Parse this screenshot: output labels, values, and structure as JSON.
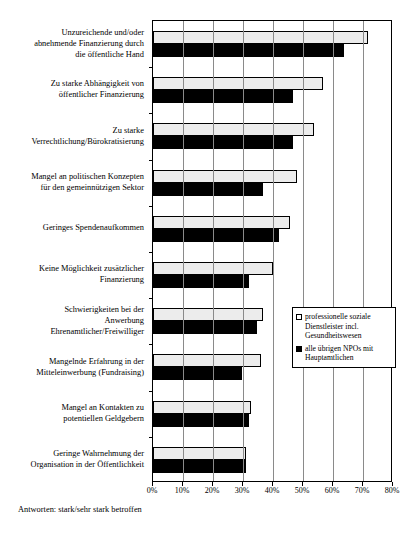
{
  "chart_data": {
    "type": "bar",
    "orientation": "horizontal",
    "title": "",
    "xlabel": "",
    "ylabel": "",
    "xlim": [
      0,
      80
    ],
    "xtick_labels": [
      "0%",
      "10%",
      "20%",
      "30%",
      "40%",
      "50%",
      "60%",
      "70%",
      "80%"
    ],
    "xtick_values": [
      0,
      10,
      20,
      30,
      40,
      50,
      60,
      70,
      80
    ],
    "grid": true,
    "legend_position": "center-right",
    "categories": [
      "Unzureichende und/oder abnehmende Finanzierung durch die öffentliche Hand",
      "Zu starke Abhängigkeit von öffentlicher Finanzierung",
      "Zu starke Verrechtlichung/Bürokratisierung",
      "Mangel an politischen Konzepten für den gemeinnützigen Sektor",
      "Geringes Spendenaufkommen",
      "Keine Möglichkeit zusätzlicher Finanzierung",
      "Schwierigkeiten bei der Anwerbung Ehrenamtlicher/Freiwilliger",
      "Mangelnde Erfahrung in der Mitteleinwerbung (Fundraising)",
      "Mangel an Kontakten zu potentiellen Geldgebern",
      "Geringe Wahrnehmung der Organisation in der Öffentlichkeit"
    ],
    "series": [
      {
        "name": "professionelle soziale Dienstleister incl. Gesundheitswesen",
        "color": "#ececec",
        "values": [
          71.5,
          56.5,
          53.5,
          48.0,
          45.5,
          40.0,
          36.5,
          36.0,
          32.5,
          31.0
        ]
      },
      {
        "name": "alle übrigen NPOs mit Hauptamtlichen",
        "color": "#000000",
        "values": [
          63.5,
          46.5,
          46.5,
          36.5,
          42.0,
          32.0,
          34.5,
          29.5,
          32.0,
          31.0
        ]
      }
    ],
    "footnote": "Antworten: stark/sehr stark betroffen"
  },
  "legend": {
    "items": [
      {
        "swatch": "light",
        "lines": [
          "professionelle soziale",
          "Dienstleister incl.",
          "Gesundheitswesen"
        ]
      },
      {
        "swatch": "dark",
        "lines": [
          "alle übrigen NPOs mit",
          "Hauptamtlichen"
        ]
      }
    ]
  },
  "category_label_lines": [
    [
      "Unzureichende und/oder",
      "abnehmende Finanzierung durch",
      "die öffentliche Hand"
    ],
    [
      "Zu starke Abhängigkeit von",
      "öffentlicher Finanzierung"
    ],
    [
      "Zu starke",
      "Verrechtlichung/Bürokratisierung"
    ],
    [
      "Mangel an politischen Konzepten",
      "für den gemeinnützigen Sektor"
    ],
    [
      "Geringes Spendenaufkommen"
    ],
    [
      "Keine Möglichkeit zusätzlicher",
      "Finanzierung"
    ],
    [
      "Schwierigkeiten bei der",
      "Anwerbung",
      "Ehrenamtlicher/Freiwilliger"
    ],
    [
      "Mangelnde Erfahrung in der",
      "Mitteleinwerbung (Fundraising)"
    ],
    [
      "Mangel an Kontakten zu",
      "potentiellen Geldgebern"
    ],
    [
      "Geringe Wahrnehmung der",
      "Organisation in der Öffentlichkeit"
    ]
  ]
}
